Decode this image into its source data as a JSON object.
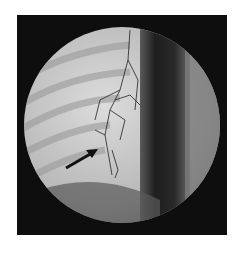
{
  "image": {
    "subject": "fluoroscopic chest X-ray with contrast-filled vessels",
    "annotation": {
      "type": "arrow",
      "color": "#111111",
      "from": [
        66,
        168
      ],
      "to": [
        97,
        150
      ]
    },
    "colors": {
      "background": "#ffffff",
      "frame": "#0e0e0e",
      "lung_field": "#c8c8c8",
      "mediastinum": "#2a2a2a"
    }
  }
}
